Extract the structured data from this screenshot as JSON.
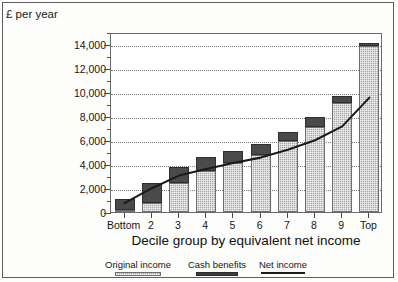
{
  "chart_data": {
    "type": "bar",
    "title": "",
    "subtitle": "",
    "y_unit_caption": "£ per year",
    "xlabel": "Decile group by equivalent net income",
    "ylabel": "",
    "ylim": [
      0,
      15000
    ],
    "ytick_values": [
      0,
      2000,
      4000,
      6000,
      8000,
      10000,
      12000,
      14000
    ],
    "ytick_labels": [
      "0",
      "2,000",
      "4,000",
      "6,000",
      "8,000",
      "10,000",
      "12,000",
      "14,000"
    ],
    "yminor_values": [
      1000,
      3000,
      5000,
      7000,
      9000,
      11000,
      13000,
      15000
    ],
    "grid": true,
    "grid_style": "dotted",
    "grid_axis": "y",
    "legend_position": "bottom",
    "stacked": true,
    "categories": [
      "Bottom",
      "2",
      "3",
      "4",
      "5",
      "6",
      "7",
      "8",
      "9",
      "Top"
    ],
    "series": [
      {
        "name": "Original income",
        "type": "bar",
        "fill": "light-grey-hatch",
        "color": "#a8a8a8",
        "values": [
          150,
          750,
          2400,
          3400,
          4050,
          4750,
          5900,
          7100,
          9050,
          13800
        ]
      },
      {
        "name": "Cash benefits",
        "type": "bar",
        "fill": "dark-grey-solid",
        "color": "#4a4a4a",
        "values": [
          900,
          1700,
          1350,
          1150,
          1050,
          950,
          800,
          850,
          650,
          300
        ]
      },
      {
        "name": "Net income",
        "type": "line",
        "color": "#1b1b1b",
        "values": [
          900,
          2150,
          3200,
          3750,
          4250,
          4700,
          5350,
          6150,
          7300,
          9700
        ]
      }
    ],
    "bar_totals": [
      1050,
      2450,
      3750,
      4550,
      5100,
      5700,
      6700,
      7950,
      9700,
      14100
    ]
  },
  "legend": {
    "items": [
      {
        "label": "Original income",
        "swatch": "hatch-swatch"
      },
      {
        "label": "Cash benefits",
        "swatch": "solid-dark-swatch"
      },
      {
        "label": "Net income",
        "swatch": "line-swatch"
      }
    ]
  },
  "colors": {
    "original_income": "#a8a8a8",
    "cash_benefits": "#4a4a4a",
    "net_income_line": "#1b1b1b",
    "gridline": "#7d7d7d",
    "axis": "#6a6a6a",
    "text": "#161616",
    "background": "#ffffff"
  }
}
